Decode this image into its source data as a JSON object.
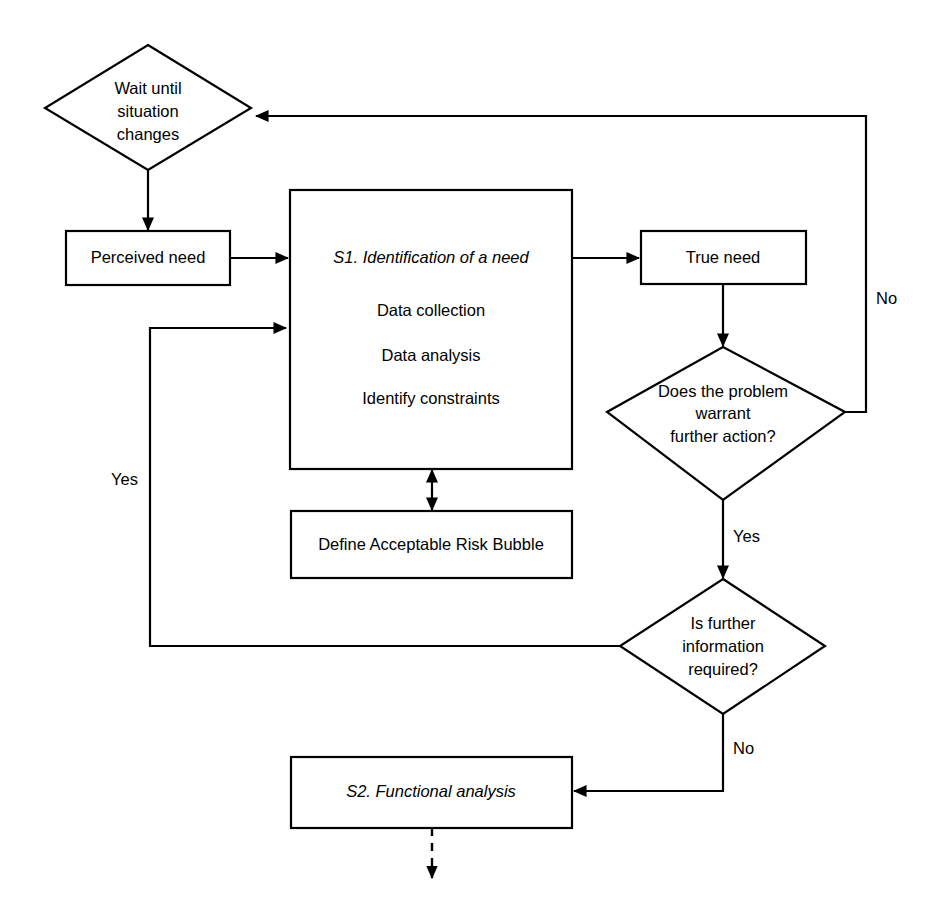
{
  "diagram": {
    "background_color": "#ffffff",
    "line_color": "#000000",
    "text_color": "#000000",
    "nodes": {
      "wait": {
        "shape": "diamond",
        "lines": [
          "Wait until",
          "situation",
          "changes"
        ]
      },
      "perceived_need": {
        "shape": "rectangle",
        "label": "Perceived need"
      },
      "s1": {
        "shape": "rectangle",
        "title": "S1. Identification of a need",
        "items": [
          "Data collection",
          "Data analysis",
          "Identify constraints"
        ]
      },
      "true_need": {
        "shape": "rectangle",
        "label": "True need"
      },
      "risk_bubble": {
        "shape": "rectangle",
        "label": "Define Acceptable Risk Bubble"
      },
      "decision_warrant": {
        "shape": "diamond",
        "lines": [
          "Does the problem",
          "warrant",
          "further action?"
        ]
      },
      "decision_info": {
        "shape": "diamond",
        "lines": [
          "Is further",
          "information",
          "required?"
        ]
      },
      "s2": {
        "shape": "rectangle",
        "label": "S2. Functional analysis"
      }
    },
    "edge_labels": {
      "warrant_no": "No",
      "warrant_yes": "Yes",
      "info_yes": "Yes",
      "info_no": "No"
    }
  }
}
